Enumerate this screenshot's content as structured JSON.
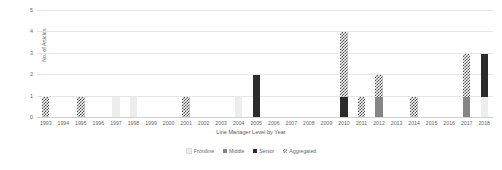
{
  "chart_data": {
    "type": "bar",
    "title": "",
    "xlabel": "Line Manager Level by Year",
    "ylabel": "No. of Articles",
    "stacked": true,
    "grid": true,
    "legend_position": "bottom",
    "ylim": [
      0,
      5
    ],
    "yticks": [
      0,
      1,
      2,
      3,
      4,
      5
    ],
    "ytick_labels": [
      "0",
      "1",
      "2",
      "3",
      "4",
      "5"
    ],
    "categories": [
      "1993",
      "1994",
      "1995",
      "1996",
      "1997",
      "1998",
      "1999",
      "2000",
      "2001",
      "2002",
      "2003",
      "2004",
      "2005",
      "2006",
      "2007",
      "2008",
      "2009",
      "2010",
      "2011",
      "2012",
      "2013",
      "2014",
      "2015",
      "2016",
      "2017",
      "2018"
    ],
    "series": [
      {
        "name": "Frontline",
        "color": "#ededed",
        "pattern": "solid",
        "values": [
          0,
          0,
          0,
          0,
          1,
          1,
          0,
          0,
          0,
          0,
          0,
          1,
          0,
          0,
          0,
          0,
          0,
          0,
          0,
          0,
          0,
          0,
          0,
          0,
          0,
          1
        ]
      },
      {
        "name": "Middle",
        "color": "#868686",
        "pattern": "solid",
        "values": [
          0,
          0,
          0,
          0,
          0,
          0,
          0,
          0,
          0,
          0,
          0,
          0,
          0,
          0,
          0,
          0,
          0,
          0,
          0,
          1,
          0,
          0,
          0,
          0,
          1,
          0
        ]
      },
      {
        "name": "Senior",
        "color": "#2b2b2b",
        "pattern": "solid",
        "values": [
          0,
          0,
          0,
          0,
          0,
          0,
          0,
          0,
          0,
          0,
          0,
          0,
          2,
          0,
          0,
          0,
          0,
          1,
          0,
          0,
          0,
          0,
          0,
          0,
          0,
          2
        ]
      },
      {
        "name": "Aggregated",
        "color": "#4a4a4a",
        "pattern": "hatched",
        "values": [
          1,
          0,
          1,
          0,
          0,
          0,
          0,
          0,
          1,
          0,
          0,
          0,
          0,
          0,
          0,
          0,
          0,
          3,
          1,
          1,
          0,
          1,
          0,
          0,
          2,
          0
        ]
      }
    ]
  }
}
